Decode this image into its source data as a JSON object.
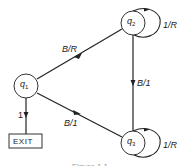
{
  "diagram": {
    "type": "state-transition-diagram",
    "nodes": [
      {
        "id": "q1",
        "label": "q",
        "sub": "1"
      },
      {
        "id": "q2",
        "label": "q",
        "sub": "2"
      },
      {
        "id": "q3",
        "label": "q",
        "sub": "3"
      },
      {
        "id": "exit",
        "label": "EXIT"
      }
    ],
    "edges": [
      {
        "from": "q1",
        "to": "q2",
        "label": "B/R"
      },
      {
        "from": "q2",
        "to": "q3",
        "label": "B/1"
      },
      {
        "from": "q3",
        "to": "q1",
        "label": "B/1"
      },
      {
        "from": "q1",
        "to": "exit",
        "label": "1"
      },
      {
        "from": "q2",
        "to": "q2",
        "label": "1/R"
      },
      {
        "from": "q3",
        "to": "q3",
        "label": "1/R"
      }
    ],
    "caption": "Figure 1.1"
  }
}
